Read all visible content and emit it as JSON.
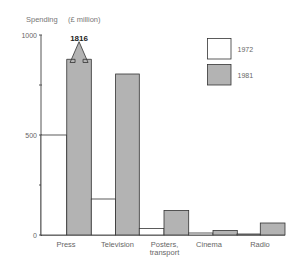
{
  "chart_data": {
    "type": "bar",
    "title": "Spending",
    "ylabel": "(£ million)",
    "xlabel": "",
    "categories": [
      "Press",
      "Television",
      "Posters, transport",
      "Cinema",
      "Radio"
    ],
    "category_lines": [
      [
        "Press"
      ],
      [
        "Television"
      ],
      [
        "Posters,",
        "transport"
      ],
      [
        "Cinema"
      ],
      [
        "Radio"
      ]
    ],
    "series": [
      {
        "name": "1972",
        "color": "#ffffff",
        "values": [
          500,
          180,
          33,
          10,
          5
        ]
      },
      {
        "name": "1981",
        "color": "#b3b3b3",
        "values": [
          1816,
          805,
          123,
          23,
          60
        ]
      }
    ],
    "ylim": [
      0,
      1000
    ],
    "yticks": [
      0,
      250,
      500,
      750,
      1000
    ],
    "ytick_labels": [
      "0",
      "",
      "500",
      "",
      "1000"
    ],
    "annotations": [
      {
        "category": "Press",
        "series": "1981",
        "text": "1816",
        "note": "bar exceeds axis, drawn with arrow"
      }
    ],
    "legend": {
      "position": "upper right",
      "entries": [
        "1972",
        "1981"
      ]
    },
    "grid": false
  }
}
